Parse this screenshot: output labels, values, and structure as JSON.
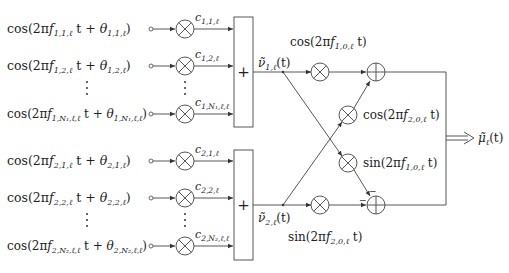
{
  "inputs": [
    {
      "id": "in-1-1",
      "fn": "cos(2π",
      "f": "f",
      "fsub": "1,1,ℓ",
      "mid": " t + ",
      "th": "θ",
      "thsub": "1,1,ℓ",
      "close": ")",
      "coef": "c",
      "coefsub": "1,1,ℓ"
    },
    {
      "id": "in-1-2",
      "fn": "cos(2π",
      "f": "f",
      "fsub": "1,2,ℓ",
      "mid": " t + ",
      "th": "θ",
      "thsub": "1,2,ℓ",
      "close": ")",
      "coef": "c",
      "coefsub": "1,2,ℓ"
    },
    {
      "id": "in-1-N",
      "fn": "cos(2π",
      "f": "f",
      "fsub": "1,N₁,ℓ,ℓ",
      "mid": " t + ",
      "th": "θ",
      "thsub": "1,N₁,ℓ,ℓ",
      "close": ")",
      "coef": "c",
      "coefsub": "1,N₁,ℓ,ℓ"
    },
    {
      "id": "in-2-1",
      "fn": "cos(2π",
      "f": "f",
      "fsub": "2,1,ℓ",
      "mid": " t + ",
      "th": "θ",
      "thsub": "2,1,ℓ",
      "close": ")",
      "coef": "c",
      "coefsub": "2,1,ℓ"
    },
    {
      "id": "in-2-2",
      "fn": "cos(2π",
      "f": "f",
      "fsub": "2,2,ℓ",
      "mid": " t + ",
      "th": "θ",
      "thsub": "2,2,ℓ",
      "close": ")",
      "coef": "c",
      "coefsub": "2,2,ℓ"
    },
    {
      "id": "in-2-N",
      "fn": "cos(2π",
      "f": "f",
      "fsub": "2,N₂,ℓ,ℓ",
      "mid": " t + ",
      "th": "θ",
      "thsub": "2,N₂,ℓ,ℓ",
      "close": ")",
      "coef": "c",
      "coefsub": "2,N₂,ℓ,ℓ"
    }
  ],
  "summers": {
    "plus": "+"
  },
  "dots": "⋮",
  "signals": {
    "nu1": {
      "base": "ν̃",
      "sub": "1,ℓ",
      "arg": "(t)"
    },
    "nu2": {
      "base": "ν̃",
      "sub": "2,ℓ",
      "arg": "(t)"
    },
    "mu": {
      "base": "μ̃",
      "sub": "ℓ",
      "arg": "(t)"
    }
  },
  "carriers": {
    "cos1": {
      "pre": "cos(2π",
      "f": "f",
      "sub": "1,0,ℓ",
      "post": " t)"
    },
    "cos2": {
      "pre": "cos(2π",
      "f": "f",
      "sub": "2,0,ℓ",
      "post": " t)"
    },
    "sin1": {
      "pre": "sin(2π",
      "f": "f",
      "sub": "1,0,ℓ",
      "post": " t)"
    },
    "sin2": {
      "pre": "sin(2π",
      "f": "f",
      "sub": "2,0,ℓ",
      "post": " t)"
    }
  },
  "adder2_signs": {
    "top": "−",
    "left": "−"
  }
}
